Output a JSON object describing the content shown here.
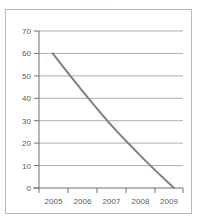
{
  "figure": {
    "title_remnant": "· · · ·",
    "frame_color": "#b9b9b9",
    "background": "#ffffff"
  },
  "chart_data": {
    "type": "line",
    "title": "",
    "subtitle": "",
    "xlabel": "",
    "ylabel": "",
    "x": [
      2005,
      2006,
      2007,
      2008,
      2009
    ],
    "categories": [
      "2005",
      "2006",
      "2007",
      "2008",
      "2009"
    ],
    "values": [
      60,
      43,
      27,
      13,
      0
    ],
    "series": [
      {
        "name": "",
        "values": [
          60,
          43,
          27,
          13,
          0
        ]
      }
    ],
    "xlim": [
      2004.55,
      2009.3
    ],
    "ylim": [
      0,
      70
    ],
    "ytick_values": [
      0,
      10,
      20,
      30,
      40,
      50,
      60,
      70
    ],
    "ytick_labels": [
      "0",
      "10",
      "20",
      "30",
      "40",
      "50",
      "60",
      "70"
    ],
    "xtick_labels": [
      "2005",
      "2006",
      "2007",
      "2008",
      "2009"
    ],
    "grid": true,
    "grid_axis": "y",
    "grid_color": "#8a8a8a",
    "legend": false,
    "legend_position": "none",
    "line_color": "#808080",
    "line_width": 2,
    "markers": false,
    "annotations": []
  },
  "axes": {
    "y_labels": [
      "70",
      "60",
      "50",
      "40",
      "30",
      "20",
      "10",
      "0"
    ],
    "x_labels": [
      "2005",
      "2006",
      "2007",
      "2008",
      "2009"
    ]
  }
}
